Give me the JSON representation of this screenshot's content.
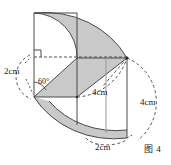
{
  "figure": {
    "caption": "图 4",
    "labels": {
      "left_radius": "2cm",
      "angle": "60°",
      "inner_arc": "4cm",
      "right_arc": "4cm",
      "bottom_arc": "2cm"
    },
    "colors": {
      "shading": "#c9c9c9",
      "stroke": "#4a4a4a",
      "dashed": "#555555",
      "background": "#ffffff",
      "text": "#1a1a1a"
    },
    "geometry": {
      "description": "solid-of-revolution cutaway with quarter-circle arcs and crescent shading",
      "apex_left": [
        34,
        97
      ],
      "center_junction": [
        77,
        97
      ],
      "apex_right": [
        127,
        58
      ],
      "rect_top_left": [
        34,
        13
      ],
      "dashed_axis_y": 57,
      "base_bottom_y": 138
    }
  }
}
